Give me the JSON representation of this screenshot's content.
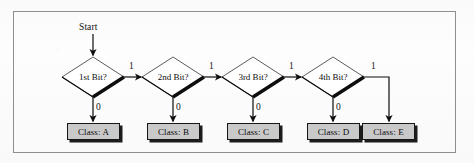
{
  "figure": {
    "kind": "flowchart",
    "frame_color": "#8d8d92",
    "background_color": "#fdfdfd",
    "node_fill": "#ffffff",
    "box_fill": "#c9c9c9",
    "ink_color": "#0d0d0d"
  },
  "start": {
    "label": "Start"
  },
  "decisions": [
    {
      "id": "bit1",
      "label": "1st Bit?",
      "yes_label": "1",
      "no_label": "0"
    },
    {
      "id": "bit2",
      "label": "2nd Bit?",
      "yes_label": "1",
      "no_label": "0"
    },
    {
      "id": "bit3",
      "label": "3rd Bit?",
      "yes_label": "1",
      "no_label": "0"
    },
    {
      "id": "bit4",
      "label": "4th Bit?",
      "yes_label": "1",
      "no_label": "0"
    }
  ],
  "outcomes": [
    {
      "id": "classA",
      "label": "Class: A"
    },
    {
      "id": "classB",
      "label": "Class: B"
    },
    {
      "id": "classC",
      "label": "Class: C"
    },
    {
      "id": "classD",
      "label": "Class: D"
    },
    {
      "id": "classE",
      "label": "Class: E"
    }
  ],
  "edges": [
    {
      "from": "start",
      "to": "bit1",
      "label": ""
    },
    {
      "from": "bit1",
      "to": "classA",
      "label": "0"
    },
    {
      "from": "bit1",
      "to": "bit2",
      "label": "1"
    },
    {
      "from": "bit2",
      "to": "classB",
      "label": "0"
    },
    {
      "from": "bit2",
      "to": "bit3",
      "label": "1"
    },
    {
      "from": "bit3",
      "to": "classC",
      "label": "0"
    },
    {
      "from": "bit3",
      "to": "bit4",
      "label": "1"
    },
    {
      "from": "bit4",
      "to": "classD",
      "label": "0"
    },
    {
      "from": "bit4",
      "to": "classE",
      "label": "1"
    }
  ]
}
